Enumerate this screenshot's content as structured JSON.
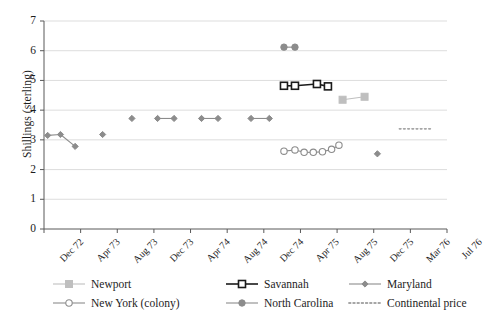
{
  "chart_data": {
    "type": "line",
    "title": "",
    "xlabel": "",
    "ylabel": "Shillings (sterling)",
    "ylim": [
      0,
      7
    ],
    "yticks": [
      0,
      1,
      2,
      3,
      4,
      5,
      6,
      7
    ],
    "ytick_labels": [
      "0",
      "1",
      "2",
      "3",
      "4",
      "5",
      "6",
      "7"
    ],
    "xtick_labels": [
      "Dec 72",
      "Apr 73",
      "Aug 73",
      "Dec 73",
      "Apr 74",
      "Aug 74",
      "Dec 74",
      "Apr 75",
      "Aug 75",
      "Dec 75",
      "Mar 76",
      "Jul 76"
    ],
    "grid": "horizontal",
    "legend_position": "bottom",
    "series": [
      {
        "name": "Newport",
        "color": "#bfbfbf",
        "marker": "square-filled",
        "points": [
          {
            "x": 8.15,
            "y": 4.35
          },
          {
            "x": 8.75,
            "y": 4.45
          }
        ]
      },
      {
        "name": "Savannah",
        "color": "#1a1a1a",
        "marker": "square-open",
        "points": [
          {
            "x": 6.55,
            "y": 4.82
          },
          {
            "x": 6.85,
            "y": 4.82
          },
          {
            "x": 7.45,
            "y": 4.88
          },
          {
            "x": 7.75,
            "y": 4.8
          }
        ]
      },
      {
        "name": "Maryland",
        "color": "#8c8c8c",
        "marker": "diamond",
        "points": [
          {
            "x": 0.1,
            "y": 3.15
          },
          {
            "x": 0.45,
            "y": 3.18
          },
          {
            "x": 0.85,
            "y": 2.78
          },
          {
            "x": 1.6,
            "y": 3.18
          },
          {
            "x": 2.4,
            "y": 3.72
          },
          {
            "x": 3.1,
            "y": 3.72
          },
          {
            "x": 3.55,
            "y": 3.72
          },
          {
            "x": 4.3,
            "y": 3.72
          },
          {
            "x": 4.75,
            "y": 3.72
          },
          {
            "x": 5.65,
            "y": 3.72
          },
          {
            "x": 6.15,
            "y": 3.72
          },
          {
            "x": 9.1,
            "y": 2.53
          }
        ]
      },
      {
        "name": "New York (colony)",
        "color": "#8c8c8c",
        "marker": "circle-open",
        "points": [
          {
            "x": 6.55,
            "y": 2.62
          },
          {
            "x": 6.85,
            "y": 2.66
          },
          {
            "x": 7.1,
            "y": 2.58
          },
          {
            "x": 7.35,
            "y": 2.58
          },
          {
            "x": 7.6,
            "y": 2.6
          },
          {
            "x": 7.85,
            "y": 2.68
          },
          {
            "x": 8.05,
            "y": 2.82
          }
        ]
      },
      {
        "name": "North Carolina",
        "color": "#8c8c8c",
        "marker": "circle-filled",
        "points": [
          {
            "x": 6.55,
            "y": 6.12
          },
          {
            "x": 6.85,
            "y": 6.12
          }
        ]
      },
      {
        "name": "Continental price",
        "color": "#a6a6a6",
        "marker": "none",
        "style": "dotted",
        "points": [
          {
            "x": 9.7,
            "y": 3.37
          },
          {
            "x": 10.55,
            "y": 3.37
          }
        ]
      }
    ]
  },
  "legend": {
    "items": [
      {
        "label": "Newport",
        "key": "newport"
      },
      {
        "label": "Savannah",
        "key": "savannah"
      },
      {
        "label": "Maryland",
        "key": "maryland"
      },
      {
        "label": "New York (colony)",
        "key": "new-york-colony"
      },
      {
        "label": "North Carolina",
        "key": "north-carolina"
      },
      {
        "label": "Continental price",
        "key": "continental-price"
      }
    ]
  },
  "colors": {
    "grid": "#d9d9d9",
    "axis": "#595959",
    "gray": "#8c8c8c",
    "light_gray": "#bfbfbf",
    "black": "#1a1a1a"
  }
}
